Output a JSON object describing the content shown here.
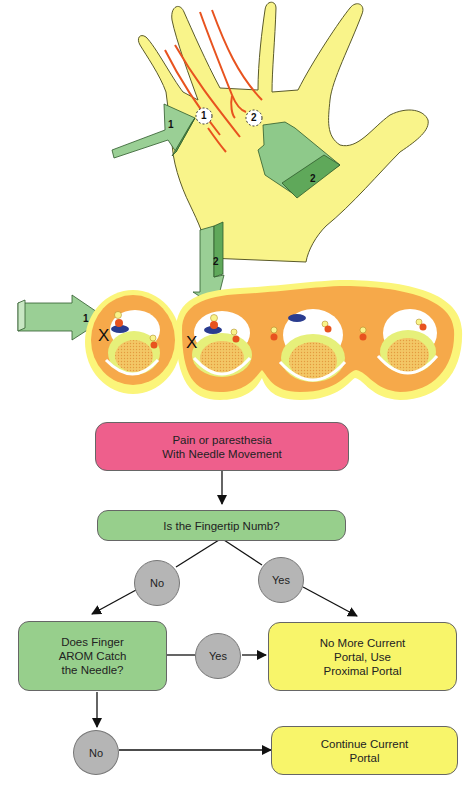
{
  "illustration": {
    "hand": {
      "portal_markers": [
        {
          "label": "1"
        },
        {
          "label": "2"
        }
      ],
      "approach_arrows": [
        {
          "label": "1"
        },
        {
          "label": "2"
        }
      ]
    },
    "cross_section": {
      "arrows": [
        {
          "label": "1"
        },
        {
          "label": "2"
        }
      ],
      "x_markers": [
        "X",
        "X"
      ]
    },
    "colors": {
      "skin": "#f9f48a",
      "nerve": "#e8531f",
      "arrow_light": "#9acf95",
      "arrow_dark": "#5fa85a",
      "tissue_orange": "#f6a94a",
      "tissue_outer": "#fbf57a",
      "nerve_blue": "#2a3c8f"
    }
  },
  "flowchart": {
    "start": {
      "text": "Pain or paresthesia\nWith Needle Movement"
    },
    "q1": {
      "text": "Is the Fingertip Numb?"
    },
    "q1_no": {
      "text": "No"
    },
    "q1_yes": {
      "text": "Yes"
    },
    "q2": {
      "text": "Does Finger\nAROM Catch\nthe Needle?"
    },
    "q2_yes": {
      "text": "Yes"
    },
    "q2_no": {
      "text": "No"
    },
    "result_proximal": {
      "text": "No More Current\nPortal, Use\nProximal Portal"
    },
    "result_continue": {
      "text": "Continue Current\nPortal"
    },
    "colors": {
      "start": "#ee5f8c",
      "question": "#97cf8c",
      "result": "#f8f56a",
      "decision_circle": "#b5b5b5"
    }
  }
}
